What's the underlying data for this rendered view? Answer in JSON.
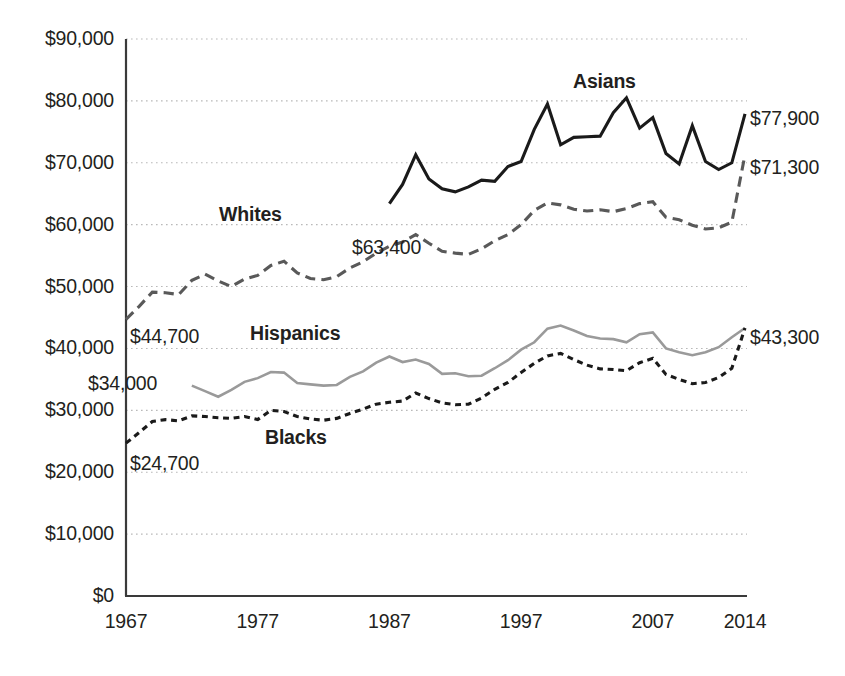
{
  "chart_data": {
    "type": "line",
    "title": "",
    "subtitle": "",
    "xlabel": "",
    "ylabel": "",
    "grid": true,
    "legend_position": "inline-labels",
    "xlim": [
      1967,
      2014
    ],
    "ylim": [
      0,
      90000
    ],
    "y_ticks": [
      {
        "value": 0,
        "label": "$0"
      },
      {
        "value": 10000,
        "label": "$10,000"
      },
      {
        "value": 20000,
        "label": "$20,000"
      },
      {
        "value": 30000,
        "label": "$30,000"
      },
      {
        "value": 40000,
        "label": "$40,000"
      },
      {
        "value": 50000,
        "label": "$50,000"
      },
      {
        "value": 60000,
        "label": "$60,000"
      },
      {
        "value": 70000,
        "label": "$70,000"
      },
      {
        "value": 80000,
        "label": "$80,000"
      },
      {
        "value": 90000,
        "label": "$90,000"
      }
    ],
    "x_ticks": [
      {
        "value": 1967,
        "label": "1967"
      },
      {
        "value": 1977,
        "label": "1977"
      },
      {
        "value": 1987,
        "label": "1987"
      },
      {
        "value": 1997,
        "label": "1997"
      },
      {
        "value": 2007,
        "label": "2007"
      },
      {
        "value": 2014,
        "label": "2014"
      }
    ],
    "series": [
      {
        "name": "Asians",
        "label": "Asians",
        "style": "solid",
        "color": "#1a1a1a",
        "width": 3.1,
        "label_pos": {
          "x": 573,
          "y": 70
        },
        "start_annotation": {
          "text": "$63,400",
          "x": 352,
          "y": 236
        },
        "end_annotation": {
          "text": "$77,900",
          "x": 750,
          "y": 107
        },
        "x": [
          1987,
          1988,
          1989,
          1990,
          1991,
          1992,
          1993,
          1994,
          1995,
          1996,
          1997,
          1998,
          1999,
          2000,
          2001,
          2002,
          2003,
          2004,
          2005,
          2006,
          2007,
          2008,
          2009,
          2010,
          2011,
          2012,
          2013,
          2014
        ],
        "values": [
          63400,
          66500,
          71300,
          67400,
          65800,
          65300,
          66100,
          67200,
          67000,
          69400,
          70200,
          75400,
          79500,
          72900,
          74100,
          74200,
          74300,
          78100,
          80500,
          75600,
          77300,
          71500,
          69800,
          76000,
          70200,
          68900,
          70000,
          77900
        ]
      },
      {
        "name": "Whites",
        "label": "Whites",
        "style": "dashed",
        "color": "#595959",
        "width": 3.1,
        "label_pos": {
          "x": 219,
          "y": 203
        },
        "start_annotation": {
          "text": "$44,700",
          "x": 130,
          "y": 325
        },
        "end_annotation": {
          "text": "$71,300",
          "x": 750,
          "y": 156
        },
        "x": [
          1967,
          1968,
          1969,
          1970,
          1971,
          1972,
          1973,
          1974,
          1975,
          1976,
          1977,
          1978,
          1979,
          1980,
          1981,
          1982,
          1983,
          1984,
          1985,
          1986,
          1987,
          1988,
          1989,
          1990,
          1991,
          1992,
          1993,
          1994,
          1995,
          1996,
          1997,
          1998,
          1999,
          2000,
          2001,
          2002,
          2003,
          2004,
          2005,
          2006,
          2007,
          2008,
          2009,
          2010,
          2011,
          2012,
          2013,
          2014
        ],
        "values": [
          44700,
          46800,
          49100,
          49000,
          48700,
          51000,
          52000,
          50900,
          50000,
          51200,
          51800,
          53400,
          54100,
          52200,
          51300,
          51100,
          51600,
          53000,
          54000,
          55400,
          56500,
          57200,
          58400,
          57000,
          55700,
          55400,
          55200,
          56100,
          57400,
          58400,
          60000,
          62300,
          63500,
          63200,
          62500,
          62200,
          62400,
          62100,
          62600,
          63400,
          63700,
          61200,
          60800,
          59900,
          59300,
          59500,
          60400,
          71300
        ]
      },
      {
        "name": "Hispanics",
        "label": "Hispanics",
        "style": "solid",
        "color": "#9a9a9a",
        "width": 2.6,
        "label_pos": {
          "x": 250,
          "y": 322
        },
        "start_annotation": {
          "text": "$34,000",
          "x": 88,
          "y": 372
        },
        "end_annotation": {
          "text": "$43,300",
          "x": 750,
          "y": 326
        },
        "x": [
          1972,
          1973,
          1974,
          1975,
          1976,
          1977,
          1978,
          1979,
          1980,
          1981,
          1982,
          1983,
          1984,
          1985,
          1986,
          1987,
          1988,
          1989,
          1990,
          1991,
          1992,
          1993,
          1994,
          1995,
          1996,
          1997,
          1998,
          1999,
          2000,
          2001,
          2002,
          2003,
          2004,
          2005,
          2006,
          2007,
          2008,
          2009,
          2010,
          2011,
          2012,
          2013,
          2014
        ],
        "values": [
          34000,
          33100,
          32200,
          33300,
          34600,
          35200,
          36200,
          36100,
          34400,
          34200,
          34000,
          34100,
          35400,
          36300,
          37700,
          38700,
          37800,
          38200,
          37500,
          35900,
          36000,
          35500,
          35600,
          36800,
          38100,
          39800,
          41000,
          43200,
          43700,
          42900,
          42000,
          41600,
          41500,
          41000,
          42300,
          42600,
          40000,
          39400,
          38900,
          39400,
          40200,
          41800,
          43300
        ]
      },
      {
        "name": "Blacks",
        "label": "Blacks",
        "style": "dotted-dash",
        "color": "#1a1a1a",
        "width": 3.1,
        "label_pos": {
          "x": 265,
          "y": 426
        },
        "start_annotation": {
          "text": "$24,700",
          "x": 130,
          "y": 452
        },
        "end_annotation": {
          "text": "",
          "x": 0,
          "y": 0
        },
        "x": [
          1967,
          1968,
          1969,
          1970,
          1971,
          1972,
          1973,
          1974,
          1975,
          1976,
          1977,
          1978,
          1979,
          1980,
          1981,
          1982,
          1983,
          1984,
          1985,
          1986,
          1987,
          1988,
          1989,
          1990,
          1991,
          1992,
          1993,
          1994,
          1995,
          1996,
          1997,
          1998,
          1999,
          2000,
          2001,
          2002,
          2003,
          2004,
          2005,
          2006,
          2007,
          2008,
          2009,
          2010,
          2011,
          2012,
          2013,
          2014
        ],
        "values": [
          24700,
          26400,
          28200,
          28500,
          28300,
          29100,
          29000,
          28800,
          28700,
          29000,
          28500,
          30000,
          29800,
          29000,
          28600,
          28400,
          28700,
          29500,
          30200,
          31000,
          31300,
          31500,
          32800,
          31900,
          31200,
          30900,
          31000,
          32000,
          33400,
          34500,
          36100,
          37600,
          38800,
          39200,
          38200,
          37300,
          36700,
          36600,
          36400,
          37700,
          38400,
          35800,
          35000,
          34300,
          34500,
          35300,
          36800,
          43300
        ]
      }
    ],
    "right_labels": [
      {
        "text": "$77,900",
        "series": "Asians"
      },
      {
        "text": "$71,300",
        "series": "Whites"
      },
      {
        "text": "$43,300",
        "series": "Hispanics"
      }
    ],
    "left_annotations": [
      {
        "text": "$44,700",
        "series": "Whites"
      },
      {
        "text": "$34,000",
        "series": "Hispanics"
      },
      {
        "text": "$24,700",
        "series": "Blacks"
      },
      {
        "text": "$63,400",
        "series": "Asians"
      }
    ]
  },
  "geometry": {
    "plot_left": 126,
    "plot_right": 745,
    "plot_top": 39,
    "plot_bottom": 596,
    "x_start_year": 1967,
    "x_end_year": 2014
  },
  "colors": {
    "axis": "#3a3a3a",
    "grid": "#b9b9b9",
    "text": "#231f20",
    "asians": "#1a1a1a",
    "whites": "#595959",
    "hispanics": "#9a9a9a",
    "blacks": "#1a1a1a"
  }
}
